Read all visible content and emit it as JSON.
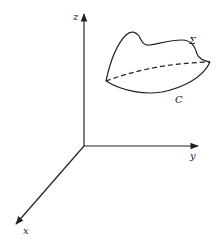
{
  "figure": {
    "axes": {
      "x_label": "x",
      "y_label": "y",
      "z_label": "z"
    },
    "surface_label": "Σ",
    "boundary_curve_label": "C",
    "colors": {
      "stroke": "#222222",
      "background": "#ffffff"
    }
  }
}
